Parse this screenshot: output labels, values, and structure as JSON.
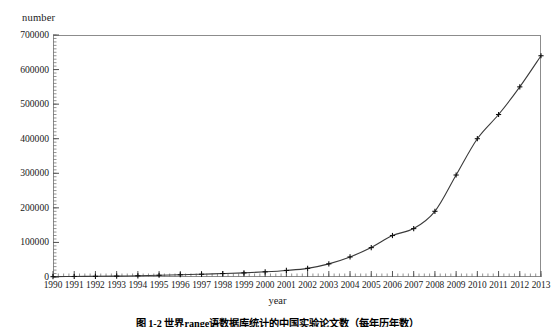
{
  "chart_data": {
    "type": "line",
    "title": "",
    "xlabel": "year",
    "ylabel": "number",
    "xlim": [
      1990,
      2013
    ],
    "ylim": [
      0,
      700000
    ],
    "grid": false,
    "legend": null,
    "marker": "plus",
    "line_color": "#3a3a3a",
    "x": [
      1990,
      1991,
      1992,
      1993,
      1994,
      1995,
      1996,
      1997,
      1998,
      1999,
      2000,
      2001,
      2002,
      2003,
      2004,
      2005,
      2006,
      2007,
      2008,
      2009,
      2010,
      2011,
      2012,
      2013
    ],
    "values": [
      1000,
      1500,
      2000,
      2500,
      3500,
      5000,
      6500,
      8000,
      10000,
      12000,
      15000,
      19000,
      25000,
      38000,
      58000,
      85000,
      120000,
      140000,
      190000,
      295000,
      400000,
      470000,
      550000,
      640000
    ],
    "xticks": [
      "1990",
      "1991",
      "1992",
      "1993",
      "1994",
      "1995",
      "1996",
      "1997",
      "1998",
      "1999",
      "2000",
      "2001",
      "2002",
      "2003",
      "2004",
      "2005",
      "2006",
      "2007",
      "2008",
      "2009",
      "2010",
      "2011",
      "2012",
      "2013"
    ],
    "yticks": [
      0,
      100000,
      200000,
      300000,
      400000,
      500000,
      600000,
      700000
    ],
    "ytick_labels": [
      "0",
      "100000",
      "200000",
      "300000",
      "400000",
      "500000",
      "600000",
      "700000"
    ],
    "minor_ticks": true
  },
  "caption": {
    "text": "图 1-2  世界range语数据库统计的中国实验论文数（每年历年数）"
  }
}
